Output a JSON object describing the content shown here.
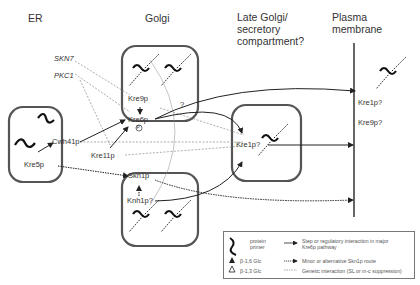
{
  "headers": {
    "er": "ER",
    "golgi": "Golgi",
    "late_golgi": [
      "Late Golgi/",
      "secretory",
      "compartment?"
    ],
    "plasma": [
      "Plasma",
      "membrane"
    ]
  },
  "genes": {
    "skn7": "SKN7",
    "pkc1": "PKC1"
  },
  "proteins": {
    "kre5p": "Kre5p",
    "cwh41p": "Cwh41p",
    "kre9p": "Kre9p",
    "kre6p": "Kre6p",
    "kre11p": "Kre11p",
    "skn1p": "Skn1p",
    "knh1p": "Knh1p?",
    "kre1p_late": "Kre1p?",
    "kre1p_pm": "Kre1p?",
    "kre9p_pm": "Kre9p?",
    "question": "?",
    "phospho": "P"
  },
  "legend": {
    "protein_primer": [
      "protein",
      "primer"
    ],
    "b16": "β-1,6 Glc",
    "b13": "β-1,3 Glc",
    "solid_arrow": [
      "Step or regulatory interaction in major",
      "Kre6p pathway"
    ],
    "dotted_arrow": "Minor or alternative Skn1p route",
    "dashed_line": "Genetic interaction (SL or m-c suppression)"
  },
  "colors": {
    "line": "#333333",
    "box": "#555555",
    "text": "#333333"
  }
}
